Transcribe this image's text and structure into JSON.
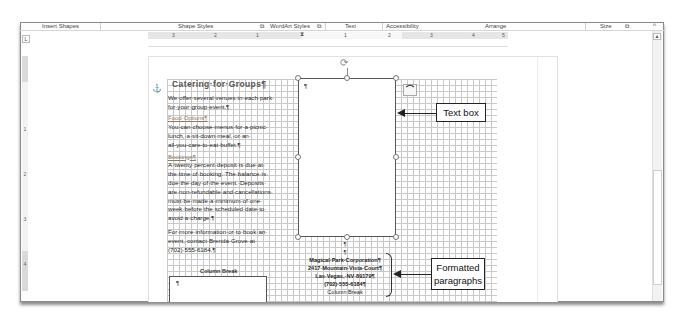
{
  "ribbon": {
    "groups": [
      {
        "label": "Insert Shapes",
        "launcher": false
      },
      {
        "label": "Shape Styles",
        "launcher": true
      },
      {
        "label": "WordArt Styles",
        "launcher": true
      },
      {
        "label": "Text",
        "launcher": false
      },
      {
        "label": "Accessibility",
        "launcher": false
      },
      {
        "label": "Arrange",
        "launcher": false
      },
      {
        "label": "Size",
        "launcher": true
      }
    ],
    "launcher_glyph": "⧉",
    "collapse_glyph": "^"
  },
  "ruler": {
    "tab_selector_glyph": "L",
    "horizontal_numbers": [
      "3",
      "2",
      "1",
      "1",
      "2",
      "3",
      "4",
      "5"
    ],
    "vertical_numbers": [
      "1",
      "2",
      "3",
      "4"
    ]
  },
  "document": {
    "anchor_glyph": "⚓",
    "left_column": {
      "title": "Catering·for·Groups¶",
      "intro": [
        "We·offer·several·venues·in·each·park·",
        "for·your·group·event.¶"
      ],
      "food_heading": "Food·Options¶",
      "food": [
        "You·can·choose·menus·for·a·picnic·",
        "lunch,·a·sit-down·meal,·or·an·",
        "all-you-care-to-eat·buffet.¶"
      ],
      "bookings_heading": "Bookings¶",
      "bookings": [
        "A·twenty·percent·deposit·is·due·at·",
        "the·time·of·booking.·The·balance·is·",
        "due·the·day·of·the·event.·Deposits·",
        "are·non-refundable·and·cancellations·",
        "must·be·made·a·minimum·of·one·",
        "week·before·the·scheduled·date·to·",
        "avoid·a·charge.¶"
      ],
      "contact": [
        "For·more·information·or·to·book·an·",
        "event,·contact·Brenda·Grove·at·",
        "(702)·555-6184.¶"
      ],
      "column_break": "Column Break",
      "lower_box_mark": "¶"
    },
    "text_box": {
      "paragraph_mark": "¶",
      "rotate_glyph": "⟳",
      "layout_options_glyph": "⌒"
    },
    "center_paragraphs": {
      "marks": [
        "¶",
        "¶"
      ],
      "lines": [
        "Magical·Park·Corporation¶",
        "2417·Mountain·Vista·Court¶",
        "Las·Vegas,·NV·89179¶",
        "(702)·555-6184¶"
      ],
      "column_break": "Column Break"
    }
  },
  "callouts": {
    "text_box": "Text box",
    "formatted_paragraphs_line1": "Formatted",
    "formatted_paragraphs_line2": "paragraphs"
  },
  "scrollbar": {
    "up_glyph": "▲"
  }
}
